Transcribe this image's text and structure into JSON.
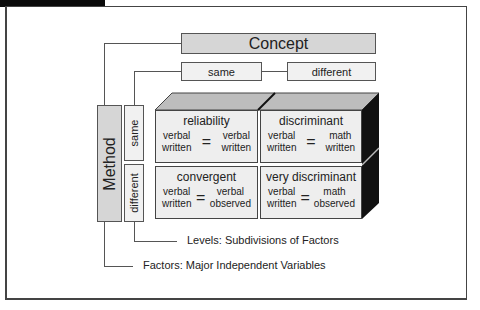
{
  "diagram": {
    "concept": {
      "label": "Concept",
      "levels": [
        "same",
        "different"
      ]
    },
    "method": {
      "label": "Method",
      "levels": [
        "same",
        "different"
      ]
    },
    "cells": [
      {
        "title": "reliability",
        "left": [
          "verbal",
          "written"
        ],
        "symbol": "=",
        "right": [
          "verbal",
          "written"
        ]
      },
      {
        "title": "discriminant",
        "left": [
          "verbal",
          "written"
        ],
        "symbol": "=",
        "right": [
          "math",
          "written"
        ]
      },
      {
        "title": "convergent",
        "left": [
          "verbal",
          "written"
        ],
        "symbol": "=",
        "right": [
          "verbal",
          "observed"
        ]
      },
      {
        "title": "very discriminant",
        "left": [
          "verbal",
          "written"
        ],
        "symbol": "=",
        "right": [
          "math",
          "observed"
        ]
      }
    ],
    "legend": {
      "levels": "Levels: Subdivisions of Factors",
      "factors": "Factors: Major Independent Variables"
    }
  },
  "colors": {
    "factor_box": "#d6d6d6",
    "level_box": "#f1f1f1",
    "cube_front": "#eeeeee",
    "cube_top": "#bdbdbd",
    "cube_side": "#111111"
  }
}
